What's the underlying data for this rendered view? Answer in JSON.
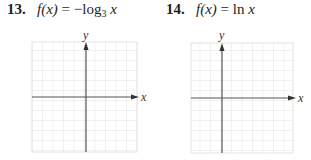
{
  "problems": [
    {
      "number": "13.",
      "lhs": "f(x)",
      "equals": "=",
      "rhs_prefix": "−log",
      "rhs_subscript": "3",
      "rhs_var": "x",
      "graph": {
        "x_axis_label": "x",
        "y_axis_label": "y",
        "grid_columns": 10,
        "grid_rows": 11
      }
    },
    {
      "number": "14.",
      "lhs": "f(x)",
      "equals": "=",
      "rhs_prefix": "ln",
      "rhs_var": "x",
      "graph": {
        "x_axis_label": "x",
        "y_axis_label": "y",
        "grid_columns": 10,
        "grid_rows": 11
      }
    }
  ],
  "colors": {
    "grid_line": "#dcdcdc",
    "axis": "#555555",
    "text": "#231f20"
  }
}
